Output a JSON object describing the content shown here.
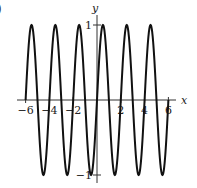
{
  "chart_data": {
    "type": "line",
    "title": "",
    "function": "y = sin(pi x)",
    "xlabel": "x",
    "ylabel": "y",
    "xlim": [
      -6.7,
      7.0
    ],
    "ylim": [
      -1.1,
      1.15
    ],
    "domain": [
      -6,
      6
    ],
    "x_ticks": [
      -6,
      -4,
      -2,
      2,
      4,
      6
    ],
    "x_tick_labels": [
      "−6",
      "−4",
      "−2",
      "2",
      "4",
      "6"
    ],
    "y_ticks": [
      1,
      -1
    ],
    "y_tick_labels": [
      "1",
      "−1"
    ],
    "period": 2,
    "amplitude": 1,
    "grid": false,
    "legend": null,
    "series": [
      {
        "name": "sin(πx)",
        "color": "#111111"
      }
    ]
  },
  "edge_mark": ")",
  "colors": {
    "curve": "#111111",
    "axis": "#333333"
  }
}
